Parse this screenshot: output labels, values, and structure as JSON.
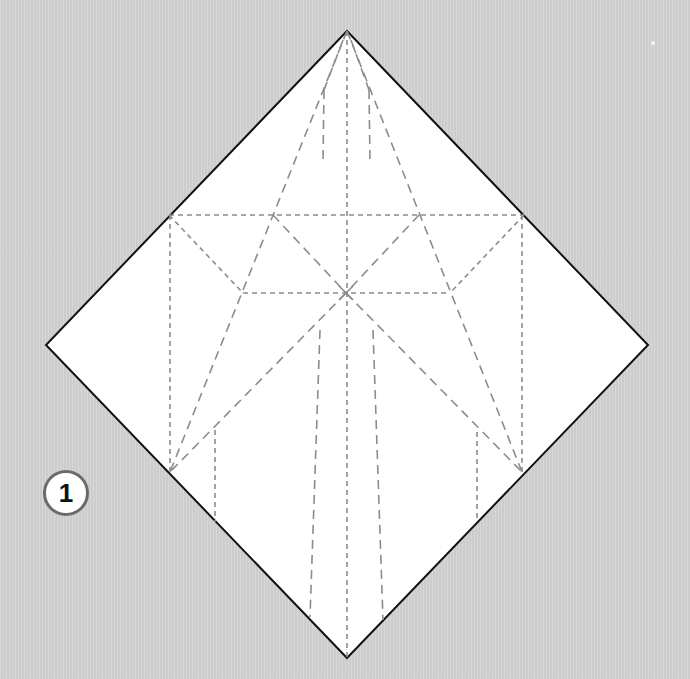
{
  "diagram": {
    "step_number": "1",
    "colors": {
      "background": "#d3d3d3",
      "paper": "#ffffff",
      "paper_edge": "#111111",
      "crease": "#8c8c8c",
      "badge_border": "#6a6a6a"
    },
    "paper_square": {
      "top": [
        347,
        31
      ],
      "right": [
        648,
        345
      ],
      "bottom": [
        347,
        658
      ],
      "left": [
        46,
        345
      ]
    },
    "key_points": {
      "center": [
        346,
        293
      ],
      "left_edge_mid": [
        169,
        215
      ],
      "right_edge_mid": [
        524,
        215
      ],
      "left_pent": [
        243,
        293
      ],
      "right_pent": [
        450,
        293
      ],
      "upper_left_cross": [
        273,
        215
      ],
      "upper_right_cross": [
        419,
        215
      ],
      "left_low_edge": [
        170,
        472
      ],
      "right_low_edge": [
        522,
        472
      ],
      "left_inner_top": [
        215,
        430
      ],
      "right_inner_top": [
        477,
        432
      ]
    },
    "labels": {
      "step": "1"
    }
  }
}
